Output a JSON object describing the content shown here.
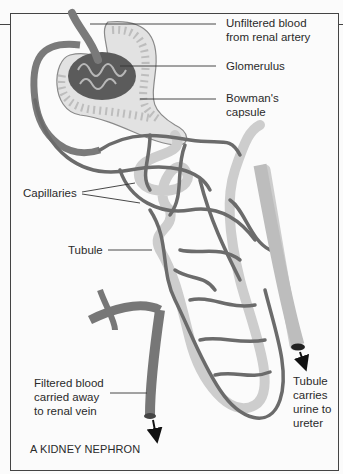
{
  "diagram": {
    "title": "A KIDNEY NEPHRON",
    "labels": {
      "unfiltered_blood": "Unfiltered blood\nfrom renal artery",
      "glomerulus": "Glomerulus",
      "bowmans_capsule": "Bowman's\ncapsule",
      "capillaries": "Capillaries",
      "tubule": "Tubule",
      "filtered_blood": "Filtered blood\ncarried away\nto renal vein",
      "tubule_urine": "Tubule\ncarries\nurine to\nureter"
    },
    "colors": {
      "vessel": "#6f6f6f",
      "vessel_light": "#9a9a9a",
      "tubule": "#cfcfcf",
      "capsule": "#dcdcdc",
      "glomerulus": "#555555",
      "line": "#333333",
      "background": "#fbfbfb"
    }
  }
}
